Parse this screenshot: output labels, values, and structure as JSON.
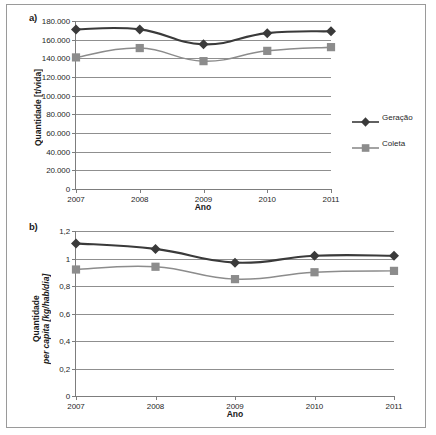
{
  "figure": {
    "panels": [
      {
        "id": "a",
        "label": "a)",
        "chart_ref": 0
      },
      {
        "id": "b",
        "label": "b)",
        "chart_ref": 1
      }
    ]
  },
  "colors": {
    "geracao": "#3a3a3a",
    "coleta": "#8c8c8c",
    "gridline": "#8f8f8f",
    "axis": "#7d7d7d",
    "frame": "#9a9a9a",
    "text": "#1f1f1f"
  },
  "chart_data": [
    {
      "type": "line",
      "panel": "a)",
      "title": "",
      "xlabel": "Ano",
      "ylabel": "Quantidade [t/vida]",
      "categories": [
        "2007",
        "2008",
        "2009",
        "2010",
        "2011"
      ],
      "x": [
        2007,
        2008,
        2009,
        2010,
        2011
      ],
      "ylim": [
        0,
        180000
      ],
      "yticks": [
        0,
        20000,
        40000,
        60000,
        80000,
        100000,
        120000,
        140000,
        160000,
        180000
      ],
      "ytick_labels": [
        "0",
        "20.000",
        "40.000",
        "60.000",
        "80.000",
        "100.000",
        "120.000",
        "140.000",
        "160.000",
        "180.000"
      ],
      "grid": true,
      "legend_position": "right",
      "series": [
        {
          "name": "Geração",
          "marker": "diamond",
          "color": "#3a3a3a",
          "values": [
            171000,
            171000,
            155000,
            167000,
            169000
          ]
        },
        {
          "name": "Coleta",
          "marker": "square",
          "color": "#8c8c8c",
          "values": [
            141000,
            151000,
            137000,
            148000,
            152000
          ]
        }
      ]
    },
    {
      "type": "line",
      "panel": "b)",
      "title": "",
      "xlabel": "Ano",
      "ylabel_line1": "Quantidade",
      "ylabel_line2": "per capita [kg/hab/dia]",
      "ylabel": "Quantidade per capita [kg/hab/dia]",
      "categories": [
        "2007",
        "2008",
        "2009",
        "2010",
        "2011"
      ],
      "x": [
        2007,
        2008,
        2009,
        2010,
        2011
      ],
      "ylim": [
        0,
        1.2
      ],
      "yticks": [
        0,
        0.2,
        0.4,
        0.6,
        0.8,
        1.0,
        1.2
      ],
      "ytick_labels": [
        "0",
        "0,2",
        "0,4",
        "0,6",
        "0,8",
        "1",
        "1,2"
      ],
      "grid": true,
      "legend_position": "none",
      "series": [
        {
          "name": "Geração",
          "marker": "diamond",
          "color": "#3a3a3a",
          "values": [
            1.11,
            1.07,
            0.97,
            1.02,
            1.02
          ]
        },
        {
          "name": "Coleta",
          "marker": "square",
          "color": "#8c8c8c",
          "values": [
            0.92,
            0.94,
            0.85,
            0.9,
            0.91
          ]
        }
      ]
    }
  ]
}
